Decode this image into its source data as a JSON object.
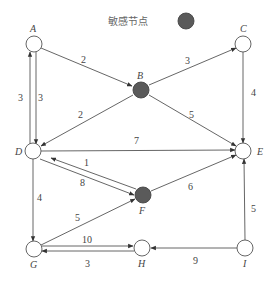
{
  "legend": {
    "label": "敏感节点",
    "color": "#5a5a5a"
  },
  "colors": {
    "edge": "#555555",
    "sensitive_node": "#5a5a5a",
    "normal_node": "#ffffff"
  },
  "nodes": [
    {
      "id": "A",
      "label": "A",
      "x": 34,
      "y": 44,
      "sensitive": false
    },
    {
      "id": "B",
      "label": "B",
      "x": 141,
      "y": 90,
      "sensitive": true
    },
    {
      "id": "C",
      "label": "C",
      "x": 243,
      "y": 44,
      "sensitive": false
    },
    {
      "id": "D",
      "label": "D",
      "x": 33,
      "y": 151,
      "sensitive": false
    },
    {
      "id": "E",
      "label": "E",
      "x": 243,
      "y": 151,
      "sensitive": false
    },
    {
      "id": "F",
      "label": "F",
      "x": 143,
      "y": 195,
      "sensitive": true
    },
    {
      "id": "G",
      "label": "G",
      "x": 34,
      "y": 249,
      "sensitive": false
    },
    {
      "id": "H",
      "label": "H",
      "x": 142,
      "y": 248,
      "sensitive": false
    },
    {
      "id": "I",
      "label": "I",
      "x": 245,
      "y": 248,
      "sensitive": false
    }
  ],
  "edges": [
    {
      "from": "A",
      "to": "B",
      "weight": "2"
    },
    {
      "from": "B",
      "to": "C",
      "weight": "3"
    },
    {
      "from": "D",
      "to": "A",
      "weight": "3"
    },
    {
      "from": "A",
      "to": "D",
      "weight": "3"
    },
    {
      "from": "B",
      "to": "D",
      "weight": "2"
    },
    {
      "from": "B",
      "to": "E",
      "weight": "5"
    },
    {
      "from": "C",
      "to": "E",
      "weight": "4"
    },
    {
      "from": "D",
      "to": "E",
      "weight": "7"
    },
    {
      "from": "F",
      "to": "D",
      "weight": "1"
    },
    {
      "from": "D",
      "to": "F",
      "weight": "8"
    },
    {
      "from": "F",
      "to": "E",
      "weight": "6"
    },
    {
      "from": "D",
      "to": "G",
      "weight": "4"
    },
    {
      "from": "G",
      "to": "F",
      "weight": "5"
    },
    {
      "from": "G",
      "to": "H",
      "weight": "10"
    },
    {
      "from": "H",
      "to": "G",
      "weight": "3"
    },
    {
      "from": "I",
      "to": "H",
      "weight": "9"
    },
    {
      "from": "I",
      "to": "E",
      "weight": "5"
    }
  ],
  "labels": {
    "A": "A",
    "B": "B",
    "C": "C",
    "D": "D",
    "E": "E",
    "F": "F",
    "G": "G",
    "H": "H",
    "I": "I"
  },
  "weights": {
    "AB": "2",
    "BC": "3",
    "DA": "3",
    "AD": "3",
    "BD": "2",
    "BE": "5",
    "CE": "4",
    "DE": "7",
    "FD": "1",
    "DF": "8",
    "FE": "6",
    "DG": "4",
    "GF": "5",
    "GH": "10",
    "HG": "3",
    "IH": "9",
    "IE": "5"
  }
}
